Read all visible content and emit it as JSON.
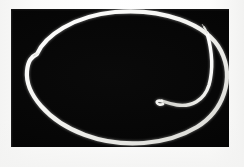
{
  "figure": {
    "caption": "",
    "medium": "photograph",
    "orientation": "landscape"
  },
  "canvas": {
    "width": 244,
    "height": 167,
    "page_background": "#ffffff"
  },
  "plate": {
    "x": 11,
    "y": 9,
    "width": 218,
    "height": 138,
    "background": "#050505",
    "label": "photographic-plate"
  },
  "colors": {
    "filament": "#f7f7f4",
    "filament_core": "#ffffff",
    "filament_shadow": "#9a9a94",
    "background": "#050505",
    "page": "#ffffff"
  },
  "strokes": {
    "main_width": 4.2,
    "inner_width": 3.4,
    "taper_min": 0.6
  },
  "shapes": {
    "outer_loop": {
      "name": "outer-loop",
      "description": "Large oval loop of filament filling the plate, open at upper left",
      "path": "M 26 45 C 34 27, 62 7, 104 3 C 150 -1, 196 14, 210 42 C 224 70, 212 102, 186 118 C 156 136, 112 140, 74 126 C 36 112, 14 84, 16 62 C 17 52, 20 48, 26 45"
    },
    "outer_loop_tail": {
      "name": "outer-loop-tail",
      "description": "Tapered free end of the outer loop pointing into the interior at upper left",
      "path": "M 26 45 C 27 44, 28 44, 28 44"
    },
    "inner_strand": {
      "name": "inner-strand",
      "description": "Second strand running parallel inside the right flank, ending in a small upturned hook near center right",
      "path": "M 196 24 C 200 38, 203 58, 198 76 C 193 92, 180 98, 166 96 C 159 95, 154 93, 151 92"
    },
    "inner_strand_hook": {
      "name": "inner-strand-hook",
      "description": "Small hooked terminus curling back upward at the free end of the inner strand",
      "path": "M 151 92 C 147 91, 145 92, 146 94 C 147 96, 150 96, 152 95"
    }
  },
  "annotations": {
    "free_end_upper_left": {
      "x": 37,
      "y": 54,
      "label": "tapered-free-end"
    },
    "free_end_hook": {
      "x": 170,
      "y": 103,
      "label": "hooked-free-end"
    },
    "inner_strand_tip": {
      "x": 206,
      "y": 34,
      "label": "inner-strand-tip"
    },
    "loop_apex_top": {
      "x": 118,
      "y": 11,
      "label": "loop-apex-top"
    },
    "loop_base_bottom": {
      "x": 126,
      "y": 145,
      "label": "loop-base-bottom"
    }
  }
}
